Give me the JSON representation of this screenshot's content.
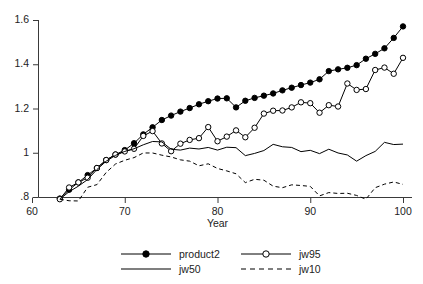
{
  "chart_data": {
    "type": "line",
    "title": "",
    "xlabel": "Year",
    "ylabel": "",
    "xlim": [
      60,
      100.5
    ],
    "ylim": [
      0.78,
      1.61
    ],
    "xticks": [
      60,
      70,
      80,
      90,
      100
    ],
    "xtick_labels": [
      "60",
      "70",
      "80",
      "90",
      "100"
    ],
    "yticks": [
      0.8,
      1.0,
      1.2,
      1.4,
      1.6
    ],
    "ytick_labels": [
      ".8",
      "1",
      "1.2",
      "1.4",
      "1.6"
    ],
    "grid": false,
    "legend_position": "bottom",
    "x": [
      63,
      64,
      65,
      66,
      67,
      68,
      69,
      70,
      71,
      72,
      73,
      74,
      75,
      76,
      77,
      78,
      79,
      80,
      81,
      82,
      83,
      84,
      85,
      86,
      87,
      88,
      89,
      90,
      91,
      92,
      93,
      94,
      95,
      96,
      97,
      98,
      99,
      100
    ],
    "series": [
      {
        "name": "product2",
        "marker": "filled-circle",
        "linestyle": "solid",
        "color": "#000000",
        "values": [
          0.793,
          0.833,
          0.866,
          0.899,
          0.931,
          0.967,
          0.992,
          1.012,
          1.043,
          1.083,
          1.115,
          1.148,
          1.168,
          1.186,
          1.202,
          1.219,
          1.233,
          1.245,
          1.246,
          1.205,
          1.235,
          1.248,
          1.258,
          1.268,
          1.282,
          1.294,
          1.306,
          1.317,
          1.332,
          1.369,
          1.377,
          1.384,
          1.396,
          1.425,
          1.447,
          1.472,
          1.519,
          1.571
        ]
      },
      {
        "name": "jw95",
        "marker": "open-circle",
        "linestyle": "solid",
        "color": "#000000",
        "values": [
          0.79,
          0.843,
          0.866,
          0.887,
          0.931,
          0.967,
          0.992,
          1.006,
          1.018,
          1.076,
          1.098,
          1.042,
          1.007,
          1.041,
          1.058,
          1.066,
          1.116,
          1.052,
          1.073,
          1.101,
          1.07,
          1.113,
          1.177,
          1.19,
          1.191,
          1.205,
          1.228,
          1.224,
          1.181,
          1.215,
          1.209,
          1.313,
          1.284,
          1.288,
          1.374,
          1.385,
          1.357,
          1.429
        ]
      },
      {
        "name": "jw50",
        "marker": "none",
        "linestyle": "solid",
        "color": "#000000",
        "values": [
          0.79,
          0.824,
          0.849,
          0.879,
          0.924,
          0.962,
          0.988,
          1.006,
          1.018,
          1.036,
          1.051,
          1.049,
          1.016,
          1.012,
          1.021,
          1.017,
          1.024,
          1.012,
          1.025,
          1.023,
          0.987,
          0.997,
          1.01,
          1.038,
          1.027,
          1.024,
          1.005,
          1.011,
          0.996,
          1.016,
          0.999,
          0.99,
          0.962,
          0.987,
          1.006,
          1.047,
          1.037,
          1.039
        ]
      },
      {
        "name": "jw10",
        "marker": "none",
        "linestyle": "dashed",
        "color": "#000000",
        "values": [
          0.79,
          0.783,
          0.782,
          0.844,
          0.856,
          0.911,
          0.949,
          0.966,
          0.978,
          0.999,
          0.999,
          0.989,
          0.981,
          0.968,
          0.962,
          0.941,
          0.95,
          0.929,
          0.918,
          0.905,
          0.865,
          0.88,
          0.876,
          0.849,
          0.842,
          0.855,
          0.852,
          0.848,
          0.805,
          0.82,
          0.816,
          0.817,
          0.807,
          0.79,
          0.842,
          0.858,
          0.868,
          0.857
        ]
      }
    ],
    "legend_entries": [
      {
        "label": "product2",
        "marker": "filled-circle",
        "linestyle": "solid"
      },
      {
        "label": "jw95",
        "marker": "open-circle",
        "linestyle": "solid"
      },
      {
        "label": "jw50",
        "marker": "none",
        "linestyle": "solid"
      },
      {
        "label": "jw10",
        "marker": "none",
        "linestyle": "dashed"
      }
    ]
  },
  "axes": {
    "x_title": "Year",
    "y_tick_labels": [
      ".8",
      "1",
      "1.2",
      "1.4",
      "1.6"
    ],
    "x_tick_labels": [
      "60",
      "70",
      "80",
      "90",
      "100"
    ]
  },
  "colors": {
    "axis": "#3a3a3a",
    "series": "#000000",
    "background": "#ffffff"
  }
}
